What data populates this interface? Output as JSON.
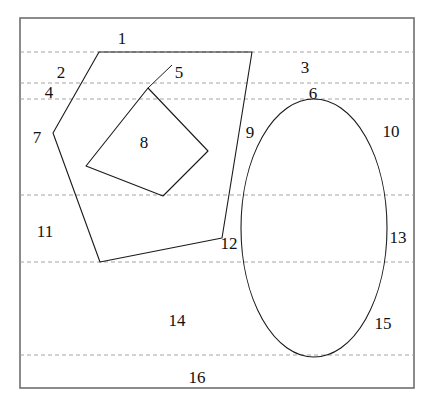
{
  "figure": {
    "type": "line-diagram",
    "width": 431,
    "height": 406,
    "colors": {
      "background": "#ffffff",
      "frame_stroke": "#6f6f6f",
      "curve_stroke": "#1a1a1a",
      "dashed_stroke": "#9a9a9a",
      "label_text": "#111111"
    },
    "frame": {
      "name": "bounding-rectangle",
      "x": 20,
      "y": 18,
      "width": 394,
      "height": 370,
      "stroke_width": 1.6
    },
    "dashed_lines": [
      {
        "name": "dashed-line-1",
        "y": 52,
        "x1": 20,
        "x2": 414
      },
      {
        "name": "dashed-line-2",
        "y": 83,
        "x1": 20,
        "x2": 414
      },
      {
        "name": "dashed-line-3",
        "y": 99,
        "x1": 20,
        "x2": 414
      },
      {
        "name": "dashed-line-4",
        "y": 195,
        "x1": 20,
        "x2": 414
      },
      {
        "name": "dashed-line-5",
        "y": 262,
        "x1": 20,
        "x2": 414
      },
      {
        "name": "dashed-line-6",
        "y": 355,
        "x1": 20,
        "x2": 414
      }
    ],
    "pentagon": {
      "name": "pentagon",
      "points": "99,52 252,52 222,238 100,262 53,133"
    },
    "quadrilateral": {
      "name": "inner-quadrilateral",
      "points": "148,88 208,151 163,196 86,166"
    },
    "ellipse": {
      "name": "ellipse",
      "cx": 314,
      "cy": 228,
      "rx": 73,
      "ry": 129
    },
    "leader_line": {
      "name": "leader-line-label-5",
      "x1": 172,
      "y1": 65,
      "x2": 148,
      "y2": 88
    },
    "labels": [
      {
        "name": "region-label-1",
        "text": "1",
        "x": 122,
        "y": 38
      },
      {
        "name": "region-label-2",
        "text": "2",
        "x": 61,
        "y": 72
      },
      {
        "name": "region-label-3",
        "text": "3",
        "x": 305,
        "y": 67
      },
      {
        "name": "region-label-4",
        "text": "4",
        "x": 49,
        "y": 92
      },
      {
        "name": "region-label-5",
        "text": "5",
        "x": 179,
        "y": 72
      },
      {
        "name": "region-label-6",
        "text": "6",
        "x": 313,
        "y": 93
      },
      {
        "name": "region-label-7",
        "text": "7",
        "x": 37,
        "y": 137
      },
      {
        "name": "region-label-8",
        "text": "8",
        "x": 144,
        "y": 142
      },
      {
        "name": "region-label-9",
        "text": "9",
        "x": 250,
        "y": 132
      },
      {
        "name": "region-label-10",
        "text": "10",
        "x": 391,
        "y": 131
      },
      {
        "name": "region-label-11",
        "text": "11",
        "x": 45,
        "y": 231
      },
      {
        "name": "region-label-12",
        "text": "12",
        "x": 229,
        "y": 243
      },
      {
        "name": "region-label-13",
        "text": "13",
        "x": 398,
        "y": 237
      },
      {
        "name": "region-label-14",
        "text": "14",
        "x": 177,
        "y": 320
      },
      {
        "name": "region-label-15",
        "text": "15",
        "x": 383,
        "y": 323
      },
      {
        "name": "region-label-16",
        "text": "16",
        "x": 197,
        "y": 377
      }
    ]
  }
}
